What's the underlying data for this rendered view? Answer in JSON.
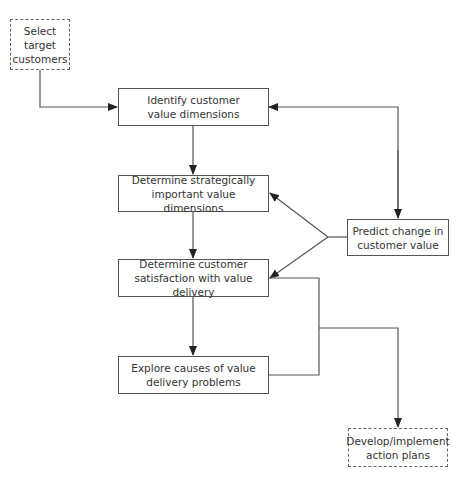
{
  "diagram": {
    "type": "flowchart",
    "colors": {
      "line": "#555555",
      "text": "#333333",
      "background": "#ffffff"
    },
    "nodes": {
      "select": {
        "label": "Select\ntarget\ncustomers",
        "style": "dashed"
      },
      "identify": {
        "label": "Identify customer\nvalue dimensions",
        "style": "solid"
      },
      "strategic": {
        "label": "Determine strategically\nimportant value dimensions",
        "style": "solid"
      },
      "satisfaction": {
        "label": "Determine customer\nsatisfaction with value delivery",
        "style": "solid"
      },
      "explore": {
        "label": "Explore causes of value\ndelivery problems",
        "style": "solid"
      },
      "predict": {
        "label": "Predict change in\ncustomer value",
        "style": "solid"
      },
      "develop": {
        "label": "Develop/implement\naction plans",
        "style": "dashed"
      }
    },
    "edges": [
      {
        "from": "select",
        "to": "identify"
      },
      {
        "from": "identify",
        "to": "strategic"
      },
      {
        "from": "strategic",
        "to": "satisfaction"
      },
      {
        "from": "satisfaction",
        "to": "explore"
      },
      {
        "from": "identify",
        "to": "predict",
        "bidirectional": true
      },
      {
        "from": "predict",
        "to": "strategic"
      },
      {
        "from": "predict",
        "to": "satisfaction"
      },
      {
        "from": "satisfaction",
        "to": "develop"
      },
      {
        "from": "explore",
        "to": "develop"
      }
    ]
  }
}
